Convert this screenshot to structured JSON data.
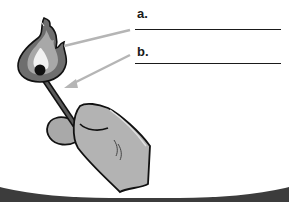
{
  "diagram": {
    "labels": [
      {
        "id": "a",
        "text": "a.",
        "points_to": "flame",
        "answer": ""
      },
      {
        "id": "b",
        "text": "b.",
        "points_to": "matchstick",
        "answer": ""
      }
    ],
    "colors": {
      "frame": "#3c3c3c",
      "background": "#ffffff",
      "flame_outer": "#6e6e6e",
      "flame_inner": "#a8a8a8",
      "flame_core": "#f2f2f2",
      "match_head": "#111111",
      "stick": "#444444",
      "hand": "#b3b3b3",
      "arrow": "#b5b5b5",
      "ink": "#1a1a1a"
    }
  }
}
